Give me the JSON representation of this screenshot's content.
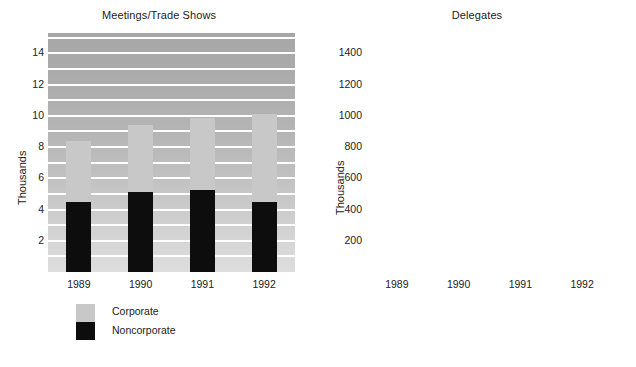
{
  "figure": {
    "width": 636,
    "height": 367,
    "background": "#ffffff",
    "plot_background_top": "#a7a7a7",
    "plot_background_bottom": "#dedede",
    "gridline_color": "#ffffff"
  },
  "legend": {
    "entries": [
      {
        "label": "Corporate",
        "color": "#c8c8c8"
      },
      {
        "label": "Noncorporate",
        "color": "#0d0d0d"
      }
    ]
  },
  "chart_data": [
    {
      "type": "bar",
      "id": "meetings-trade-shows",
      "stacked": true,
      "title": "Meetings/Trade Shows",
      "xlabel": "",
      "ylabel": "Thousands",
      "categories": [
        "1989",
        "1990",
        "1991",
        "1992"
      ],
      "series": [
        {
          "name": "Noncorporate",
          "color": "#0d0d0d",
          "values": [
            4.5,
            5.15,
            5.25,
            4.5
          ]
        },
        {
          "name": "Corporate",
          "color": "#c8c8c8",
          "values": [
            3.9,
            4.25,
            4.6,
            5.6
          ]
        }
      ],
      "totals": [
        8.4,
        9.4,
        9.85,
        10.1
      ],
      "ylim": [
        0,
        15.3
      ],
      "yticks": [
        2,
        4,
        6,
        8,
        10,
        12,
        14
      ],
      "ytick_labels": [
        "2",
        "4",
        "6",
        "8",
        "10",
        "12",
        "14"
      ],
      "gridlines": [
        1,
        2,
        3,
        4,
        5,
        6,
        7,
        8,
        9,
        10,
        11,
        12,
        13,
        14,
        15
      ],
      "grid": true,
      "legend_position": "below-left"
    },
    {
      "type": "bar",
      "id": "delegates",
      "stacked": true,
      "title": "Delegates",
      "xlabel": "",
      "ylabel": "Thousands",
      "categories": [
        "1989",
        "1990",
        "1991",
        "1992"
      ],
      "series": [
        {
          "name": "Noncorporate",
          "color": "#0d0d0d",
          "values": [
            845,
            870,
            840,
            950
          ]
        },
        {
          "name": "Corporate",
          "color": "#c8c8c8",
          "values": [
            335,
            380,
            430,
            450
          ]
        }
      ],
      "totals": [
        1180,
        1250,
        1270,
        1400
      ],
      "ylim": [
        0,
        1530
      ],
      "yticks": [
        200,
        400,
        600,
        800,
        1000,
        1200,
        1400
      ],
      "ytick_labels": [
        "200",
        "400",
        "600",
        "800",
        "1000",
        "1200",
        "1400"
      ],
      "gridlines": [
        100,
        200,
        300,
        400,
        500,
        600,
        700,
        800,
        900,
        1000,
        1100,
        1200,
        1300,
        1400,
        1500
      ],
      "grid": true,
      "legend_position": "below-left"
    }
  ]
}
